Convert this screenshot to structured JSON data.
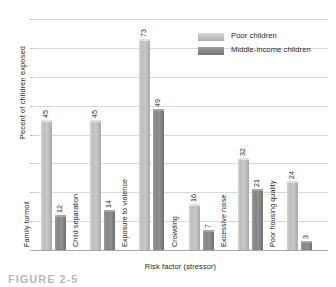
{
  "chart_data": {
    "type": "bar",
    "title": "",
    "xlabel": "Risk factor (stressor)",
    "ylabel": "Pecent of children exposed",
    "ylim": [
      0,
      80
    ],
    "yticks": [
      0,
      10,
      20,
      30,
      40,
      50,
      60,
      70,
      80
    ],
    "grid": true,
    "legend_position": "upper right",
    "categories": [
      "Family turmoil",
      "Child separation",
      "Exposure to violence",
      "Crowding",
      "Excessive noise",
      "Poor housing quality"
    ],
    "series": [
      {
        "name": "Poor children",
        "color": "#c4c4c4",
        "values": [
          45,
          45,
          73,
          16,
          32,
          24
        ]
      },
      {
        "name": "Middle-income children",
        "color": "#8a8a8a",
        "values": [
          12,
          14,
          49,
          7,
          21,
          3
        ]
      }
    ]
  },
  "legend": {
    "items": [
      {
        "label": "Poor children",
        "swatch": "light-gray-swatch"
      },
      {
        "label": "Middle-income children",
        "swatch": "dark-gray-swatch"
      }
    ]
  },
  "caption": {
    "text": "FIGURE 2-5"
  }
}
